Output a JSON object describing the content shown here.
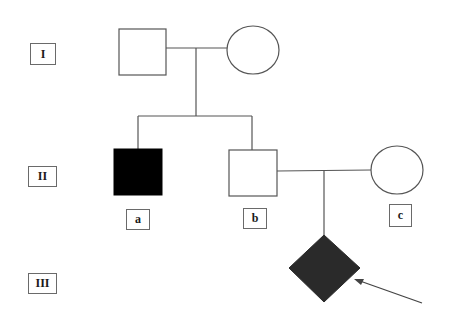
{
  "diagram": {
    "type": "pedigree",
    "generations": [
      {
        "id": "gen-1",
        "label": "I"
      },
      {
        "id": "gen-2",
        "label": "II"
      },
      {
        "id": "gen-3",
        "label": "III"
      }
    ],
    "individuals": [
      {
        "id": "I-1",
        "generation": "I",
        "shape": "square",
        "sex": "male",
        "affected": false
      },
      {
        "id": "I-2",
        "generation": "I",
        "shape": "circle",
        "sex": "female",
        "affected": false
      },
      {
        "id": "II-a",
        "generation": "II",
        "shape": "square",
        "sex": "male",
        "affected": true,
        "label": "a"
      },
      {
        "id": "II-b",
        "generation": "II",
        "shape": "square",
        "sex": "male",
        "affected": false,
        "label": "b"
      },
      {
        "id": "II-c",
        "generation": "II",
        "shape": "circle",
        "sex": "female",
        "affected": false,
        "label": "c"
      },
      {
        "id": "III-1",
        "generation": "III",
        "shape": "diamond",
        "sex": "unknown",
        "affected": true,
        "proband": true
      }
    ],
    "relationships": [
      {
        "type": "mating",
        "partners": [
          "I-1",
          "I-2"
        ],
        "children": [
          "II-a",
          "II-b"
        ]
      },
      {
        "type": "mating",
        "partners": [
          "II-b",
          "II-c"
        ],
        "children": [
          "III-1"
        ]
      }
    ],
    "person_labels": {
      "a": "a",
      "b": "b",
      "c": "c"
    },
    "proband_indicator": "arrow",
    "colors": {
      "line": "#555555",
      "affected_male": "#000000",
      "affected_proband": "#2a2a2a",
      "unaffected_fill": "#ffffff"
    }
  }
}
